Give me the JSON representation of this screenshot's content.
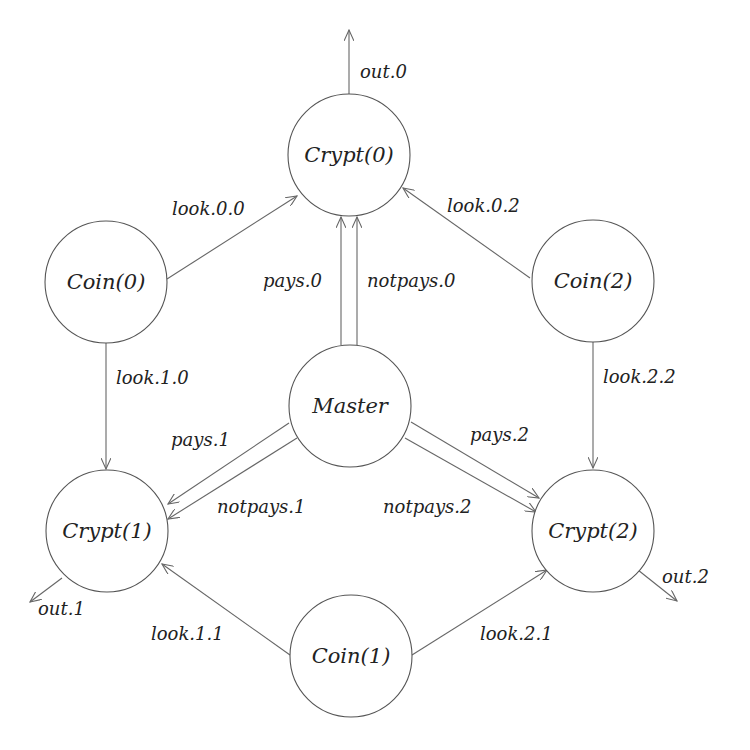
{
  "diagram": {
    "line_color": "#666666",
    "node_stroke": "#555555",
    "text_color": "#222222",
    "nodes": [
      {
        "id": "crypt0",
        "label": "Crypt(0)",
        "cx": 349,
        "cy": 155,
        "r": 61
      },
      {
        "id": "coin0",
        "label": "Coin(0)",
        "cx": 106,
        "cy": 282,
        "r": 61
      },
      {
        "id": "coin2",
        "label": "Coin(2)",
        "cx": 593,
        "cy": 281,
        "r": 61
      },
      {
        "id": "master",
        "label": "Master",
        "cx": 350,
        "cy": 406,
        "r": 61
      },
      {
        "id": "crypt1",
        "label": "Crypt(1)",
        "cx": 107,
        "cy": 531,
        "r": 61
      },
      {
        "id": "crypt2",
        "label": "Crypt(2)",
        "cx": 593,
        "cy": 531,
        "r": 61
      },
      {
        "id": "coin1",
        "label": "Coin(1)",
        "cx": 351,
        "cy": 656,
        "r": 61
      }
    ],
    "edges": [
      {
        "id": "out0",
        "label": "out.0",
        "from": "crypt0",
        "to": "external",
        "x1": 349,
        "y1": 94,
        "x2": 349,
        "y2": 30,
        "lx": 360,
        "ly": 78
      },
      {
        "id": "look00",
        "label": "look.0.0",
        "from": "coin0",
        "to": "crypt0",
        "x1": 167,
        "y1": 279,
        "x2": 297,
        "y2": 196,
        "lx": 172,
        "ly": 215
      },
      {
        "id": "look02",
        "label": "look.0.2",
        "from": "coin2",
        "to": "crypt0",
        "x1": 530,
        "y1": 278,
        "x2": 403,
        "y2": 188,
        "lx": 447,
        "ly": 212
      },
      {
        "id": "pays0",
        "label": "pays.0",
        "from": "master",
        "to": "crypt0",
        "x1": 341,
        "y1": 345,
        "x2": 341,
        "y2": 217,
        "lx": 263,
        "ly": 287
      },
      {
        "id": "notpays0",
        "label": "notpays.0",
        "from": "master",
        "to": "crypt0",
        "x1": 357,
        "y1": 345,
        "x2": 357,
        "y2": 217,
        "lx": 367,
        "ly": 287
      },
      {
        "id": "look10",
        "label": "look.1.0",
        "from": "coin0",
        "to": "crypt1",
        "x1": 106,
        "y1": 343,
        "x2": 106,
        "y2": 469,
        "lx": 116,
        "ly": 384
      },
      {
        "id": "look22",
        "label": "look.2.2",
        "from": "coin2",
        "to": "crypt2",
        "x1": 593,
        "y1": 342,
        "x2": 593,
        "y2": 468,
        "lx": 603,
        "ly": 383
      },
      {
        "id": "pays1",
        "label": "pays.1",
        "from": "master",
        "to": "crypt1",
        "x1": 289,
        "y1": 423,
        "x2": 168,
        "y2": 504,
        "lx": 171,
        "ly": 446
      },
      {
        "id": "notpays1",
        "label": "notpays.1",
        "from": "master",
        "to": "crypt1",
        "x1": 297,
        "y1": 438,
        "x2": 168,
        "y2": 519,
        "lx": 217,
        "ly": 513
      },
      {
        "id": "pays2",
        "label": "pays.2",
        "from": "master",
        "to": "crypt2",
        "x1": 411,
        "y1": 422,
        "x2": 539,
        "y2": 498,
        "lx": 470,
        "ly": 441
      },
      {
        "id": "notpays2",
        "label": "notpays.2",
        "from": "master",
        "to": "crypt2",
        "x1": 405,
        "y1": 438,
        "x2": 536,
        "y2": 512,
        "lx": 383,
        "ly": 513
      },
      {
        "id": "out1",
        "label": "out.1",
        "from": "crypt1",
        "to": "external",
        "x1": 62,
        "y1": 578,
        "x2": 30,
        "y2": 602,
        "lx": 38,
        "ly": 615
      },
      {
        "id": "out2",
        "label": "out.2",
        "from": "crypt2",
        "to": "external",
        "x1": 638,
        "y1": 570,
        "x2": 677,
        "y2": 601,
        "lx": 662,
        "ly": 583
      },
      {
        "id": "look11",
        "label": "look.1.1",
        "from": "coin1",
        "to": "crypt1",
        "x1": 290,
        "y1": 655,
        "x2": 162,
        "y2": 564,
        "lx": 151,
        "ly": 640
      },
      {
        "id": "look21",
        "label": "look.2.1",
        "from": "coin1",
        "to": "crypt2",
        "x1": 412,
        "y1": 655,
        "x2": 547,
        "y2": 570,
        "lx": 480,
        "ly": 640
      }
    ]
  }
}
